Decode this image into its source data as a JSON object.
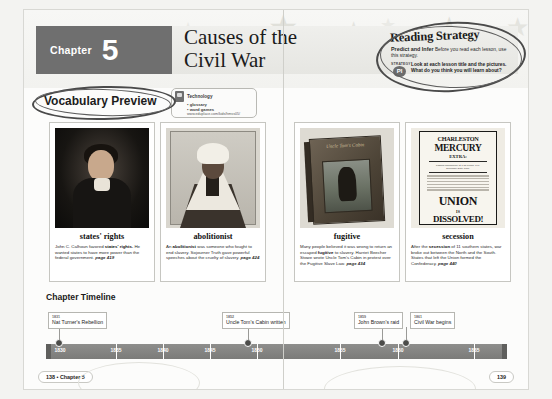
{
  "header": {
    "chapter_word": "Chapter",
    "chapter_number": "5",
    "title_line1": "Causes of the",
    "title_line2": "Civil War"
  },
  "technology": {
    "label": "Technology",
    "item1": "• glossary",
    "item2": "• word games",
    "url": "www.eduplace.com/kids/hmss05/"
  },
  "reading_strategy": {
    "title": "Reading Strategy",
    "strategy_name": "Predict and Infer",
    "strategy_note": "Before you read each lesson, use this strategy.",
    "badge_top": "STRATEGY",
    "badge_letter": "PI",
    "body": "Look at each lesson title and the pictures. What do you think you will learn about?"
  },
  "vocabulary_preview": {
    "heading": "Vocabulary Preview"
  },
  "cards": [
    {
      "term": "states' rights",
      "art": "calhoun",
      "def_pre": "John C. Calhoun favored ",
      "def_bold": "states' rights.",
      "def_post": " He wanted states to have more power than the federal government. ",
      "page": "page 419"
    },
    {
      "term": "abolitionist",
      "art": "truth",
      "def_pre": "An ",
      "def_bold": "abolitionist",
      "def_post": " was someone who fought to end slavery. Sojourner Truth gave powerful speeches about the cruelty of slavery. ",
      "page": "page 424"
    },
    {
      "term": "fugitive",
      "art": "book",
      "def_pre": "Many people believed it was wrong to return an escaped ",
      "def_bold": "fugitive",
      "def_post": " to slavery. Harriet Beecher Stowe wrote Uncle Tom's Cabin in protest over the Fugitive Slave Law. ",
      "page": "page 434"
    },
    {
      "term": "secession",
      "art": "broadside",
      "def_pre": "After the ",
      "def_bold": "secession",
      "def_post": " of 11 southern states, war broke out between the North and the South. States that left the Union formed the Confederacy. ",
      "page": "page 440"
    }
  ],
  "broadside": {
    "line_charleston": "CHARLESTON",
    "line_mercury": "MERCURY",
    "line_extra": "EXTRA:",
    "line_sub1": "Passed unanimously at 1.15 o'clock, P.M.",
    "line_sub2": "December 20th, 1860.",
    "line_union": "UNION",
    "line_is": "IS",
    "line_dissolved": "DISSOLVED!"
  },
  "book_art": {
    "cover_title": "Uncle Tom's Cabin"
  },
  "timeline": {
    "heading": "Chapter Timeline",
    "left_years": [
      "1830",
      "1835",
      "1840",
      "1845",
      "1850"
    ],
    "right_years": [
      "1855",
      "1860",
      "1865"
    ],
    "events": [
      {
        "date": "1831",
        "label": "Nat Turner's Rebellion",
        "page": "left"
      },
      {
        "date": "1852",
        "label": "Uncle Tom's Cabin written",
        "page": "left"
      },
      {
        "date": "1859",
        "label": "John Brown's raid",
        "page": "right"
      },
      {
        "date": "1861",
        "label": "Civil War begins",
        "page": "right"
      }
    ]
  },
  "footer": {
    "left": "138 • Chapter 5",
    "right": "139"
  }
}
